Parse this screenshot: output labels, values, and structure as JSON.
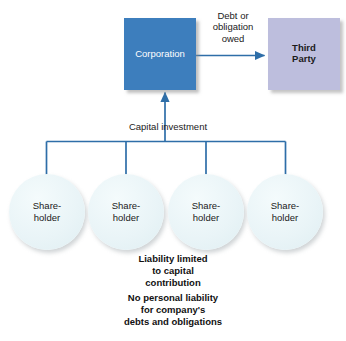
{
  "diagram": {
    "colors": {
      "corporation_fill": "#3d7ebd",
      "third_party_fill": "#bdbedd",
      "shareholder_fill": "#e9f4f7",
      "connector_line": "#2e6ea8",
      "background": "#ffffff",
      "text_dark": "#1a1a1a",
      "text_light": "#ffffff"
    },
    "nodes": {
      "corporation": {
        "label": "Corporation",
        "shape": "square"
      },
      "third_party": {
        "label_line_1": "Third",
        "label_line_2": "Party",
        "shape": "square"
      },
      "shareholders": [
        {
          "label_line_1": "Share-",
          "label_line_2": "holder"
        },
        {
          "label_line_1": "Share-",
          "label_line_2": "holder"
        },
        {
          "label_line_1": "Share-",
          "label_line_2": "holder"
        },
        {
          "label_line_1": "Share-",
          "label_line_2": "holder"
        }
      ]
    },
    "edges": {
      "debt": {
        "label_line_1": "Debt or",
        "label_line_2": "obligation",
        "label_line_3": "owed",
        "from": "corporation",
        "to": "third_party",
        "direction": "right"
      },
      "capital": {
        "label": "Capital investment",
        "from": "shareholders",
        "to": "corporation",
        "direction": "up"
      }
    },
    "notes": [
      {
        "line_1": "Liability limited",
        "line_2": "to capital",
        "line_3": "contribution"
      },
      {
        "line_1": "No personal liability",
        "line_2": "for company's",
        "line_3": "debts and obligations"
      }
    ]
  }
}
